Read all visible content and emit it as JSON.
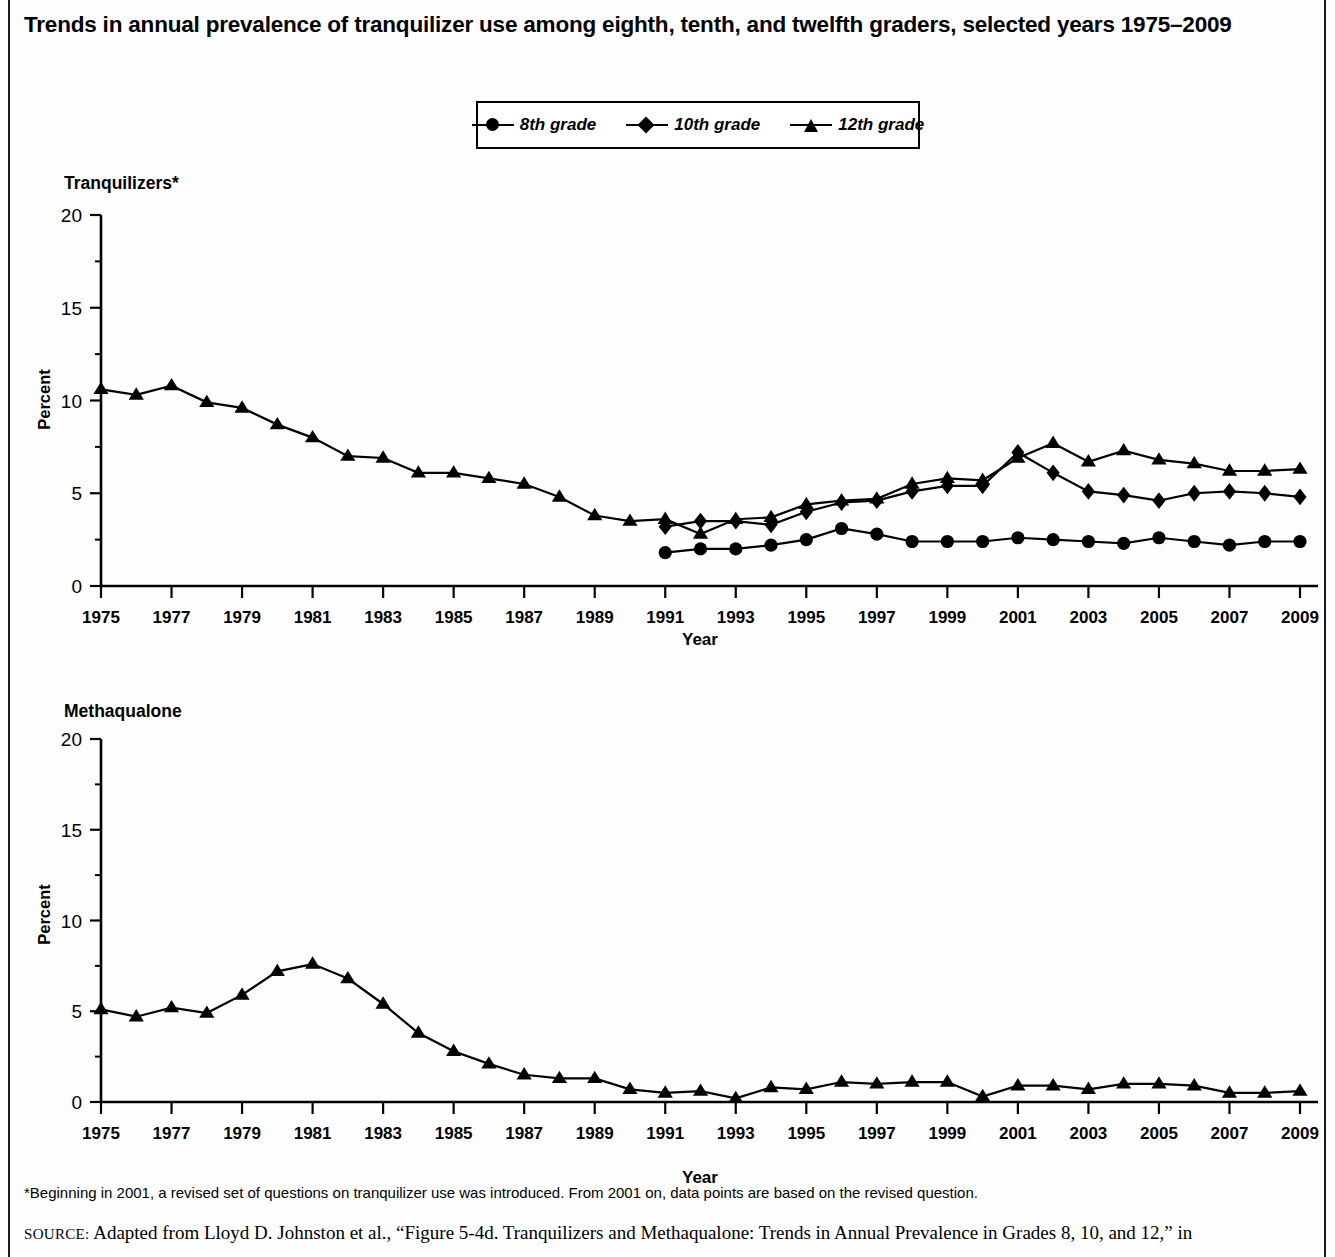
{
  "figure": {
    "title": "Trends in annual prevalence of tranquilizer use among eighth, tenth, and twelfth graders, selected years 1975–2009",
    "footnote": "*Beginning in 2001, a revised set of questions on tranquilizer use was introduced. From 2001 on, data points are based on the revised question.",
    "source_prefix": "SOURCE:",
    "source_text": " Adapted from Lloyd D. Johnston et al., “Figure 5-4d. Tranquilizers and Methaqualone: Trends in Annual Prevalence in Grades 8, 10, and 12,” in"
  },
  "legend": {
    "position": "top-center",
    "items": [
      {
        "label": "8th grade",
        "marker": "circle",
        "icon": "circle-marker-icon"
      },
      {
        "label": "10th grade",
        "marker": "diamond",
        "icon": "diamond-marker-icon"
      },
      {
        "label": "12th grade",
        "marker": "triangle",
        "icon": "triangle-marker-icon"
      }
    ]
  },
  "chart_data": [
    {
      "type": "line",
      "title": "Tranquilizers*",
      "xlabel": "Year",
      "ylabel": "Percent",
      "ylim": [
        0,
        20
      ],
      "yticks": [
        0,
        5,
        10,
        15,
        20
      ],
      "xlim": [
        1975,
        2009
      ],
      "xticks": [
        1975,
        1977,
        1979,
        1981,
        1983,
        1985,
        1987,
        1989,
        1991,
        1993,
        1995,
        1997,
        1999,
        2001,
        2003,
        2005,
        2007,
        2009
      ],
      "grid": false,
      "legend_position": "above-figure",
      "x": [
        1975,
        1976,
        1977,
        1978,
        1979,
        1980,
        1981,
        1982,
        1983,
        1984,
        1985,
        1986,
        1987,
        1988,
        1989,
        1990,
        1991,
        1992,
        1993,
        1994,
        1995,
        1996,
        1997,
        1998,
        1999,
        2000,
        2001,
        2002,
        2003,
        2004,
        2005,
        2006,
        2007,
        2008,
        2009
      ],
      "series": [
        {
          "name": "8th grade",
          "marker": "circle",
          "x": [
            1991,
            1992,
            1993,
            1994,
            1995,
            1996,
            1997,
            1998,
            1999,
            2000,
            2001,
            2002,
            2003,
            2004,
            2005,
            2006,
            2007,
            2008,
            2009
          ],
          "values": [
            1.8,
            2.0,
            2.0,
            2.2,
            2.5,
            3.1,
            2.8,
            2.4,
            2.4,
            2.4,
            2.6,
            2.5,
            2.4,
            2.3,
            2.6,
            2.4,
            2.2,
            2.4,
            2.4
          ]
        },
        {
          "name": "10th grade",
          "marker": "diamond",
          "x": [
            1991,
            1992,
            1993,
            1994,
            1995,
            1996,
            1997,
            1998,
            1999,
            2000,
            2001,
            2002,
            2003,
            2004,
            2005,
            2006,
            2007,
            2008,
            2009
          ],
          "values": [
            3.2,
            3.5,
            3.5,
            3.3,
            4.0,
            4.5,
            4.6,
            5.1,
            5.4,
            5.4,
            7.2,
            6.1,
            5.1,
            4.9,
            4.6,
            5.0,
            5.1,
            5.0,
            4.8
          ]
        },
        {
          "name": "12th grade",
          "marker": "triangle",
          "x": [
            1975,
            1976,
            1977,
            1978,
            1979,
            1980,
            1981,
            1982,
            1983,
            1984,
            1985,
            1986,
            1987,
            1988,
            1989,
            1990,
            1991,
            1992,
            1993,
            1994,
            1995,
            1996,
            1997,
            1998,
            1999,
            2000,
            2001,
            2002,
            2003,
            2004,
            2005,
            2006,
            2007,
            2008,
            2009
          ],
          "values": [
            10.6,
            10.3,
            10.8,
            9.9,
            9.6,
            8.7,
            8.0,
            7.0,
            6.9,
            6.1,
            6.1,
            5.8,
            5.5,
            4.8,
            3.8,
            3.5,
            3.6,
            2.8,
            3.6,
            3.7,
            4.4,
            4.6,
            4.7,
            5.5,
            5.8,
            5.7,
            6.9,
            7.7,
            6.7,
            7.3,
            6.8,
            6.6,
            6.2,
            6.2,
            6.3
          ]
        }
      ]
    },
    {
      "type": "line",
      "title": "Methaqualone",
      "xlabel": "Year",
      "ylabel": "Percent",
      "ylim": [
        0,
        20
      ],
      "yticks": [
        0,
        5,
        10,
        15,
        20
      ],
      "xlim": [
        1975,
        2009
      ],
      "xticks": [
        1975,
        1977,
        1979,
        1981,
        1983,
        1985,
        1987,
        1989,
        1991,
        1993,
        1995,
        1997,
        1999,
        2001,
        2003,
        2005,
        2007,
        2009
      ],
      "grid": false,
      "series": [
        {
          "name": "12th grade",
          "marker": "triangle",
          "x": [
            1975,
            1976,
            1977,
            1978,
            1979,
            1980,
            1981,
            1982,
            1983,
            1984,
            1985,
            1986,
            1987,
            1988,
            1989,
            1990,
            1991,
            1992,
            1993,
            1994,
            1995,
            1996,
            1997,
            1998,
            1999,
            2000,
            2001,
            2002,
            2003,
            2004,
            2005,
            2006,
            2007,
            2008,
            2009
          ],
          "values": [
            5.1,
            4.7,
            5.2,
            4.9,
            5.9,
            7.2,
            7.6,
            6.8,
            5.4,
            3.8,
            2.8,
            2.1,
            1.5,
            1.3,
            1.3,
            0.7,
            0.5,
            0.6,
            0.2,
            0.8,
            0.7,
            1.1,
            1.0,
            1.1,
            1.1,
            0.3,
            0.9,
            0.9,
            0.7,
            1.0,
            1.0,
            0.9,
            0.5,
            0.5,
            0.6
          ]
        }
      ]
    }
  ]
}
